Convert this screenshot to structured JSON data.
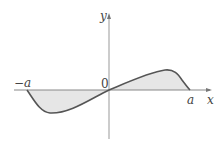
{
  "figure": {
    "labels": {
      "x_axis": "x",
      "y_axis": "y",
      "origin": "0",
      "neg_a": "−a",
      "pos_a": "a"
    },
    "colors": {
      "curve": "#555555",
      "fill": "#e6e6e6",
      "axis": "#888888"
    }
  }
}
